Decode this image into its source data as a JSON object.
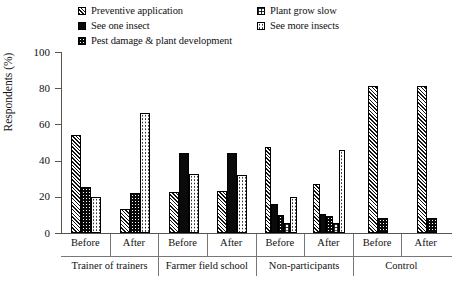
{
  "chart_data": {
    "type": "bar",
    "title": "",
    "xlabel": "",
    "ylabel": "Respondents (%)",
    "ylim": [
      0,
      100
    ],
    "yticks": [
      0,
      20,
      40,
      60,
      80,
      100
    ],
    "grid": false,
    "legend_position": "top",
    "groups": [
      "Trainer of trainers",
      "Farmer field school",
      "Non-participants",
      "Control"
    ],
    "subgroups": [
      "Before",
      "After"
    ],
    "categories": [
      "Trainer of trainers - Before",
      "Trainer of trainers - After",
      "Farmer field school - Before",
      "Farmer field school - After",
      "Non-participants - Before",
      "Non-participants - After",
      "Control - Before",
      "Control - After"
    ],
    "series": [
      {
        "name": "Preventive application",
        "pattern": "diagonal-hatch",
        "values": [
          54,
          13,
          22.5,
          23,
          47.5,
          27,
          81,
          81
        ]
      },
      {
        "name": "See one insect",
        "pattern": "solid-black",
        "values": [
          null,
          null,
          44,
          44,
          16,
          10.5,
          null,
          null
        ]
      },
      {
        "name": "Pest damage & plant development",
        "pattern": "black-with-dots",
        "values": [
          25.5,
          22,
          null,
          null,
          10,
          9.5,
          8.5,
          8.5
        ]
      },
      {
        "name": "Plant grow slow",
        "pattern": "grid-checker",
        "values": [
          null,
          null,
          null,
          null,
          5.5,
          5.5,
          null,
          null
        ]
      },
      {
        "name": "See more insects",
        "pattern": "white-with-dots",
        "values": [
          20,
          66.5,
          32.5,
          32,
          20,
          46,
          null,
          null
        ]
      }
    ]
  },
  "legend": {
    "left_column": [
      {
        "label": "Preventive application",
        "swatch": "diagonal-hatch"
      },
      {
        "label": "See one insect",
        "swatch": "solid-black"
      },
      {
        "label": "Pest damage & plant development",
        "swatch": "black-with-dots"
      }
    ],
    "right_column": [
      {
        "label": "Plant grow slow",
        "swatch": "grid-checker"
      },
      {
        "label": "See more insects",
        "swatch": "white-with-dots"
      }
    ]
  },
  "axes": {
    "y_title": "Respondents (%)",
    "y_tick_labels": [
      "0",
      "20",
      "40",
      "60",
      "80",
      "100"
    ],
    "sub_labels": [
      "Before",
      "After",
      "Before",
      "After",
      "Before",
      "After",
      "Before",
      "After"
    ],
    "group_labels": [
      "Trainer of trainers",
      "Farmer field school",
      "Non-participants",
      "Control"
    ]
  }
}
